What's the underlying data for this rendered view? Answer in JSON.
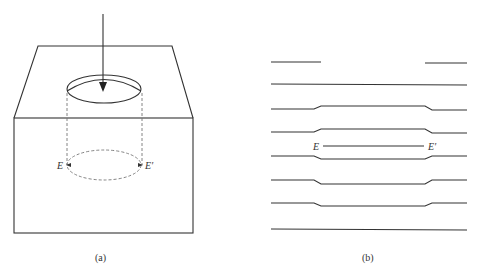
{
  "panel_a": {
    "caption": "(a)",
    "label_left": "E",
    "label_right": "E′",
    "description": "Block with circular hole on top face, downward arrow into hole, dashed cylinder projection with dashed ellipse at E–E′"
  },
  "panel_b": {
    "caption": "(b)",
    "label_left": "E",
    "label_right": "E′",
    "description": "Stacked horizontal layer lines with central region bulging around a line E–E′"
  },
  "colors": {
    "stroke": "#333333",
    "dashed": "#777777",
    "background": "#ffffff"
  }
}
